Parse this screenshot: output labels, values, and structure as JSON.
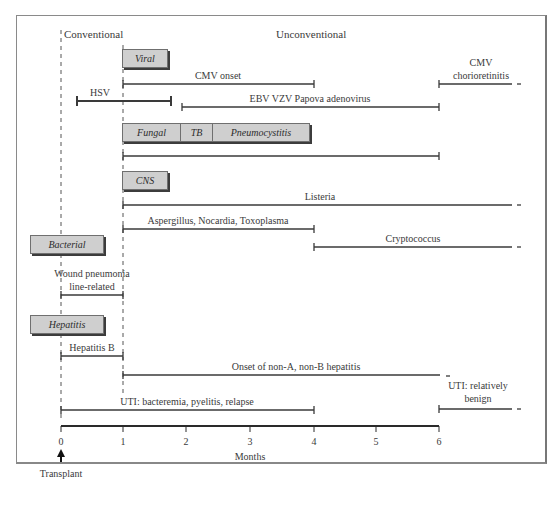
{
  "diagram": {
    "header": {
      "conventional": "Conventional",
      "unconventional": "Unconventional"
    },
    "axis": {
      "label": "Months",
      "ticks": [
        "0",
        "1",
        "2",
        "3",
        "4",
        "5",
        "6"
      ],
      "transplant_label": "Transplant"
    },
    "categories": {
      "viral": "Viral",
      "fungal": "Fungal",
      "tb": "TB",
      "pneumocystitis": "Pneumocystitis",
      "cns": "CNS",
      "bacterial": "Bacterial",
      "hepatitis": "Hepatitis"
    },
    "intervals": [
      {
        "id": "cmv-onset",
        "label": "CMV onset",
        "start": 1,
        "end": 4,
        "open_ended": false
      },
      {
        "id": "cmv-chorioretinitis",
        "label": "CMV chorioretinitis",
        "label_line1": "CMV",
        "label_line2": "chorioretinitis",
        "start": 6,
        "end": 7.2,
        "open_ended": true
      },
      {
        "id": "hsv",
        "label": "HSV",
        "start": 0.25,
        "end": 1.75,
        "open_ended": false
      },
      {
        "id": "ebv",
        "label": "EBV VZV Papova adenovirus",
        "start": 1.9,
        "end": 6,
        "open_ended": false
      },
      {
        "id": "fungal-tb-pcp",
        "label": "",
        "start": 1,
        "end": 6,
        "open_ended": false
      },
      {
        "id": "listeria",
        "label": "Listeria",
        "start": 1,
        "end": 7.2,
        "open_ended": true
      },
      {
        "id": "aspergillus",
        "label": "Aspergillus, Nocardia, Toxoplasma",
        "start": 1,
        "end": 4,
        "open_ended": false
      },
      {
        "id": "cryptococcus",
        "label": "Cryptococcus",
        "start": 4,
        "end": 7.2,
        "open_ended": true
      },
      {
        "id": "wound",
        "label": "Wound pneumonia line-related",
        "label_line1": "Wound pneumonia",
        "label_line2": "line-related",
        "start": 0,
        "end": 1,
        "open_ended": false
      },
      {
        "id": "hepatitis-b",
        "label": "Hepatitis B",
        "start": 0,
        "end": 1,
        "open_ended": false
      },
      {
        "id": "non-a-non-b",
        "label": "Onset of non-A, non-B hepatitis",
        "start": 1,
        "end": 6.2,
        "open_ended": true
      },
      {
        "id": "uti-bacteremia",
        "label": "UTI: bacteremia, pyelitis, relapse",
        "start": 0,
        "end": 4,
        "open_ended": false
      },
      {
        "id": "uti-benign",
        "label": "UTI: relatively benign",
        "label_line1": "UTI: relatively",
        "label_line2": "benign",
        "start": 6,
        "end": 7.2,
        "open_ended": true
      }
    ],
    "colors": {
      "line": "#3a3a3a",
      "box_fill": "#cfcfcf",
      "box_shadow": "#3c3c3c",
      "frame": "#8a8a8a"
    }
  }
}
